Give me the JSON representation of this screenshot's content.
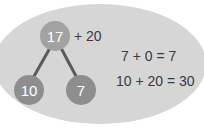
{
  "diagram": {
    "number_bond": {
      "whole": "17",
      "parts": [
        "10",
        "7"
      ],
      "addend_label": "+ 20"
    },
    "equations": [
      "7 + 0 = 7",
      "10 + 20 = 30"
    ]
  },
  "colors": {
    "background_ellipse": "#d6d6d6",
    "top_circle": "#a2a2a2",
    "part_circles": "#8e8e8e",
    "connector": "#5a5a5a",
    "text": "#3a3a3a"
  }
}
